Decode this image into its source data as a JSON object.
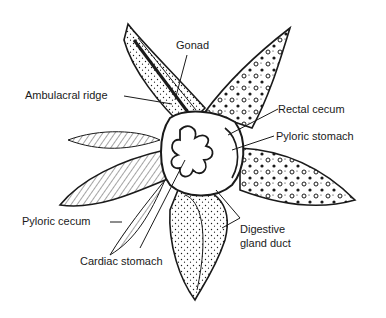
{
  "diagram": {
    "ink_color": "#1a1a1a",
    "background_color": "#ffffff",
    "labels": [
      {
        "id": "gonad",
        "text": "Gonad"
      },
      {
        "id": "ambulacral-ridge",
        "text": "Ambulacral ridge"
      },
      {
        "id": "rectal-cecum",
        "text": "Rectal cecum"
      },
      {
        "id": "pyloric-stomach",
        "text": "Pyloric stomach"
      },
      {
        "id": "pyloric-cecum",
        "text": "Pyloric cecum"
      },
      {
        "id": "cardiac-stomach",
        "text": "Cardiac stomach"
      },
      {
        "id": "digestive-gland-duct-line1",
        "text": "Digestive"
      },
      {
        "id": "digestive-gland-duct-line2",
        "text": "gland duct"
      }
    ]
  }
}
